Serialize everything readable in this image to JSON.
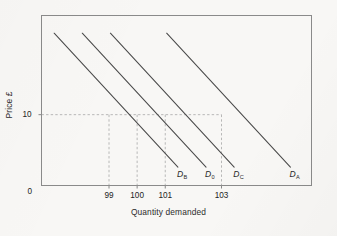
{
  "figure": {
    "background_color": "#f8f7f5",
    "frame_color": "#8a8a8a",
    "line_color": "#4a4a4a",
    "dash_color": "#b0b0b0"
  },
  "axes": {
    "ylabel": "Price £",
    "xlabel": "Quantity demanded",
    "y_ticks": [
      {
        "label": "10",
        "value": 10
      },
      {
        "label": "0",
        "value": 0
      }
    ],
    "x_ticks": [
      {
        "label": "99",
        "value": 99
      },
      {
        "label": "100",
        "value": 100
      },
      {
        "label": "101",
        "value": 101
      },
      {
        "label": "103",
        "value": 103
      }
    ]
  },
  "curve_labels": [
    {
      "name": "D",
      "sub": "B"
    },
    {
      "name": "D",
      "sub": "0"
    },
    {
      "name": "D",
      "sub": "C"
    },
    {
      "name": "D",
      "sub": "A"
    }
  ],
  "chart_data": {
    "type": "line",
    "title": "",
    "xlabel": "Quantity demanded",
    "ylabel": "Price £",
    "xlim": [
      96.6,
      106.2
    ],
    "ylim": [
      0,
      24
    ],
    "grid": false,
    "legend": "inline-end-labels",
    "x_tick_values": [
      99,
      100,
      101,
      103
    ],
    "x_tick_labels": [
      "99",
      "100",
      "101",
      "103"
    ],
    "y_tick_values": [
      0,
      10
    ],
    "y_tick_labels": [
      "0",
      "10"
    ],
    "annotations": [
      "Horizontal dashed reference line at Price = 10",
      "Vertical dashed reference lines at Quantity = 99, 100, 101, 103",
      "Four parallel downward-sloping demand curves; shifts left/right from D0"
    ],
    "series": [
      {
        "name": "D_B",
        "label": "D<sub>B</sub>",
        "quantity_at_price_10": 99,
        "points": [
          {
            "x": 97.05,
            "y": 21.5
          },
          {
            "x": 101.45,
            "y": 2.6
          }
        ]
      },
      {
        "name": "D_0",
        "label": "D<sub>0</sub>",
        "quantity_at_price_10": 100,
        "points": [
          {
            "x": 98.05,
            "y": 21.5
          },
          {
            "x": 102.45,
            "y": 2.6
          }
        ]
      },
      {
        "name": "D_C",
        "label": "D<sub>C</sub>",
        "quantity_at_price_10": 101,
        "points": [
          {
            "x": 99.05,
            "y": 21.5
          },
          {
            "x": 103.45,
            "y": 2.6
          }
        ]
      },
      {
        "name": "D_A",
        "label": "D<sub>A</sub>",
        "quantity_at_price_10": 103,
        "points": [
          {
            "x": 101.05,
            "y": 21.5
          },
          {
            "x": 105.45,
            "y": 2.6
          }
        ]
      }
    ]
  }
}
